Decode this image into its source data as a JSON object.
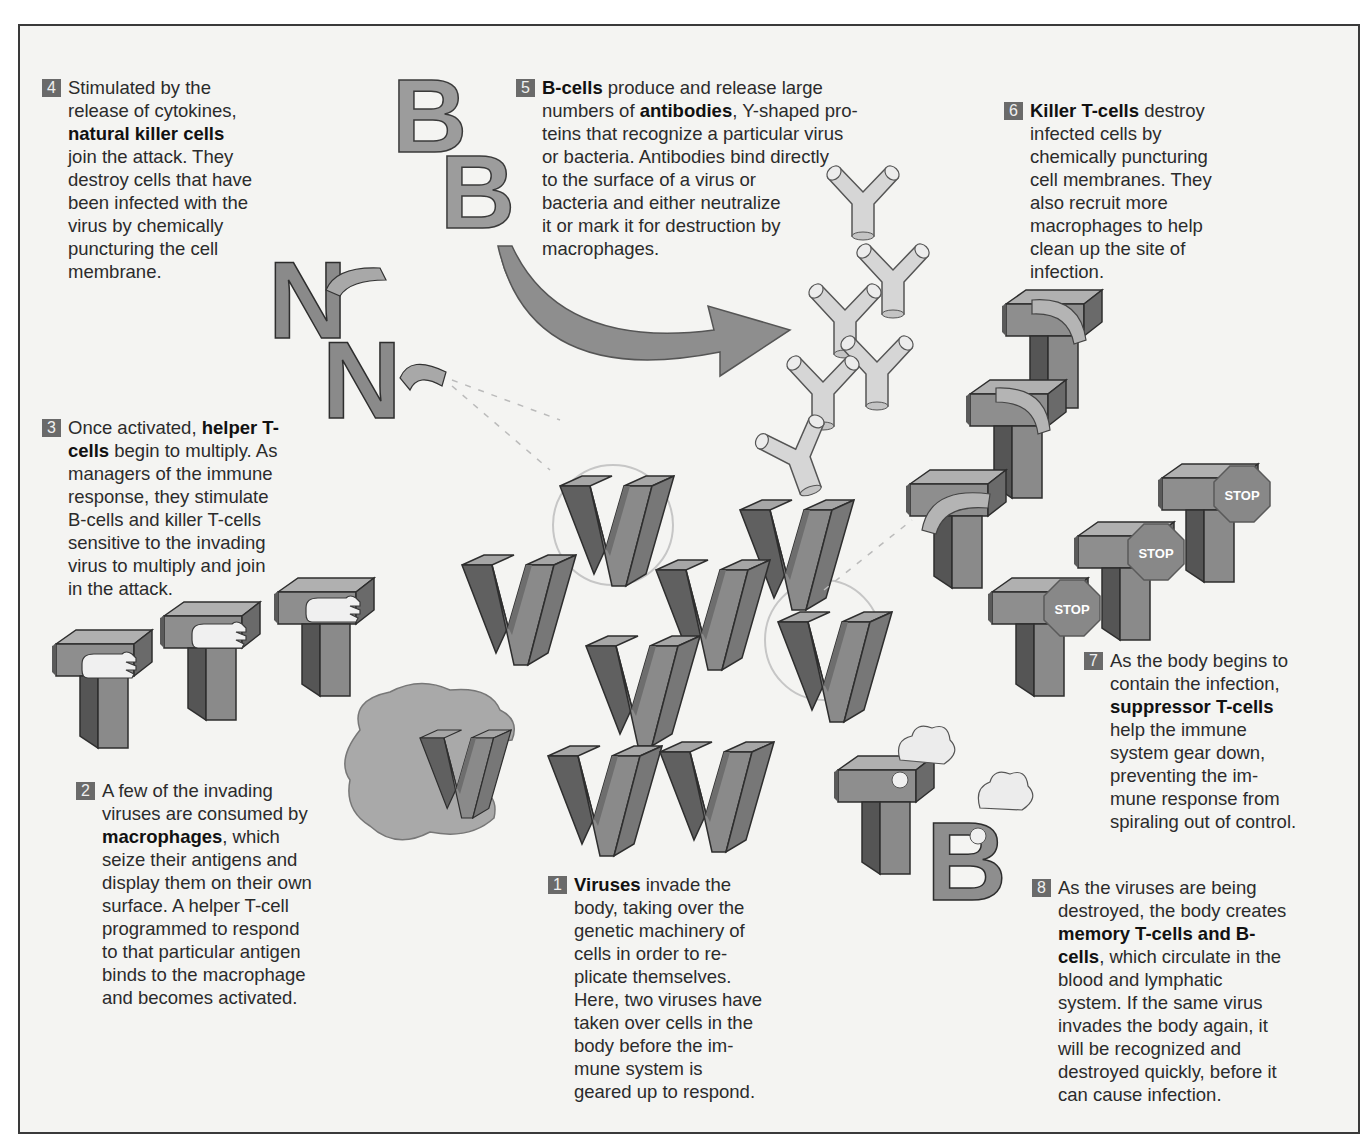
{
  "diagram": {
    "topic": "Immune response to a viral infection",
    "colors": {
      "background": "#f4f4f2",
      "frame": "#3a3a3a",
      "block_face": "#8c8c8c",
      "block_top": "#a8a8a8",
      "block_side": "#5e5e5e",
      "antibody": "#d4d4d4",
      "macrophage": "#a9a9a9",
      "number_badge": "#6a6a6a",
      "text": "#2b2b2b"
    },
    "glyphs": {
      "virus": "V",
      "b_cell": "B",
      "t_cell": "T",
      "nk_cell": "N",
      "stop_sign": "STOP"
    },
    "steps": [
      {
        "number": "1",
        "segments": [
          {
            "bold": true,
            "text": "Viruses"
          },
          {
            "bold": false,
            "text": " invade the body, taking over the genetic machinery of cells in order to re-plicate themselves. Here, two viruses have taken over cells in the body before the im-mune system is geared up to respond."
          }
        ],
        "lines": [
          "Viruses invade the",
          "body, taking over the",
          "genetic machinery of",
          "cells in order to re-",
          "plicate themselves.",
          "Here, two viruses have",
          "taken over cells in the",
          "body before the im-",
          "mune system is",
          "geared up to respond."
        ]
      },
      {
        "number": "2",
        "lines": [
          "A few of the invading",
          "viruses are consumed by",
          "macrophages, which",
          "seize their antigens and",
          "display them on their own",
          "surface. A helper T-cell",
          "programmed to respond",
          "to that particular antigen",
          "binds to the macrophage",
          "and becomes activated."
        ],
        "bold_terms": [
          "macrophages"
        ]
      },
      {
        "number": "3",
        "lines": [
          "Once activated, helper T-",
          "cells begin to multiply. As",
          "managers of the immune",
          "response, they stimulate",
          "B-cells and killer T-cells",
          "sensitive to the invading",
          "virus to multiply and join",
          "in the attack."
        ],
        "bold_terms": [
          "helper T-",
          "cells"
        ]
      },
      {
        "number": "4",
        "lines": [
          "Stimulated by the",
          "release of cytokines,",
          "natural killer cells",
          "join the attack. They",
          "destroy cells that have",
          "been infected with the",
          "virus by chemically",
          "puncturing the cell",
          "membrane."
        ],
        "bold_terms": [
          "natural killer cells"
        ]
      },
      {
        "number": "5",
        "lines": [
          "B-cells produce and release large",
          "numbers of antibodies, Y-shaped pro-",
          "teins that recognize a particular virus",
          "or bacteria. Antibodies bind directly",
          "to the surface of a virus or",
          "bacteria and either neutralize",
          "it or mark it for destruction by",
          "macrophages."
        ],
        "bold_terms": [
          "B-cells",
          "antibodies"
        ]
      },
      {
        "number": "6",
        "lines": [
          "Killer T-cells destroy",
          "infected cells by",
          "chemically puncturing",
          "cell membranes. They",
          "also recruit more",
          "macrophages to help",
          "clean up the site of",
          "infection."
        ],
        "bold_terms": [
          "Killer T-cells"
        ]
      },
      {
        "number": "7",
        "lines": [
          "As the body begins to",
          "contain the infection,",
          "suppressor T-cells",
          "help the immune",
          "system gear down,",
          "preventing the im-",
          "mune response from",
          "spiraling out of control."
        ],
        "bold_terms": [
          "suppressor T-cells"
        ]
      },
      {
        "number": "8",
        "lines": [
          "As the viruses are being",
          "destroyed, the body creates",
          "memory T-cells and B-",
          "cells, which circulate in the",
          "blood and lymphatic",
          "system. If the same virus",
          "invades the body again, it",
          "will be recognized and",
          "destroyed quickly, before it",
          "can cause infection."
        ],
        "bold_terms": [
          "memory T-cells and B-",
          "cells"
        ]
      }
    ],
    "text": {
      "s1": {
        "b1": "Viruses",
        "l1": " invade the",
        "l2": "body, taking over the",
        "l3": "genetic machinery of",
        "l4": "cells in order to re-",
        "l5": "plicate themselves.",
        "l6": "Here, two viruses have",
        "l7": "taken over cells in the",
        "l8": "body before the im-",
        "l9": "mune system is",
        "l10": "geared up to respond."
      },
      "s2": {
        "l1": "A few of the invading",
        "l2": "viruses are consumed by",
        "b1": "macrophages",
        "l3": ", which",
        "l4": "seize their antigens and",
        "l5": "display them on their own",
        "l6": "surface. A helper T-cell",
        "l7": "programmed to respond",
        "l8": "to that particular antigen",
        "l9": "binds to the macrophage",
        "l10": "and becomes activated."
      },
      "s3": {
        "l1": "Once activated, ",
        "b1": "helper T-",
        "b2": "cells",
        "l2": " begin to multiply. As",
        "l3": "managers of the immune",
        "l4": "response, they stimulate",
        "l5": "B-cells and killer T-cells",
        "l6": "sensitive to the invading",
        "l7": "virus to multiply and join",
        "l8": "in the attack."
      },
      "s4": {
        "l1": "Stimulated by the",
        "l2": "release of cytokines,",
        "b1": "natural killer cells",
        "l3": "join the attack. They",
        "l4": "destroy cells that have",
        "l5": "been infected with the",
        "l6": "virus by chemically",
        "l7": "puncturing the cell",
        "l8": "membrane."
      },
      "s5": {
        "b1": "B-cells",
        "l1": " produce and release large",
        "l2": "numbers of ",
        "b2": "antibodies",
        "l3": ", Y-shaped pro-",
        "l4": "teins that recognize a particular virus",
        "l5": "or bacteria. Antibodies bind directly",
        "l6": "to the surface of a virus or",
        "l7": "bacteria and either neutralize",
        "l8": "it or mark it for destruction by",
        "l9": "macrophages."
      },
      "s6": {
        "b1": "Killer T-cells",
        "l1": " destroy",
        "l2": "infected cells by",
        "l3": "chemically puncturing",
        "l4": "cell membranes. They",
        "l5": "also recruit more",
        "l6": "macrophages to help",
        "l7": "clean up the site of",
        "l8": "infection."
      },
      "s7": {
        "l1": "As the body begins to",
        "l2": "contain the infection,",
        "b1": "suppressor T-cells",
        "l3": "help the immune",
        "l4": "system gear down,",
        "l5": "preventing the im-",
        "l6": "mune response from",
        "l7": "spiraling out of control."
      },
      "s8": {
        "l1": "As the viruses are being",
        "l2": "destroyed, the body creates",
        "b1": "memory T-cells and B-",
        "b2": "cells",
        "l3": ", which circulate in the",
        "l4": "blood and lymphatic",
        "l5": "system. If the same virus",
        "l6": "invades the body again, it",
        "l7": "will be recognized and",
        "l8": "destroyed quickly, before it",
        "l9": "can cause infection."
      }
    },
    "nums": {
      "n1": "1",
      "n2": "2",
      "n3": "3",
      "n4": "4",
      "n5": "5",
      "n6": "6",
      "n7": "7",
      "n8": "8"
    },
    "stop_label": "STOP"
  }
}
